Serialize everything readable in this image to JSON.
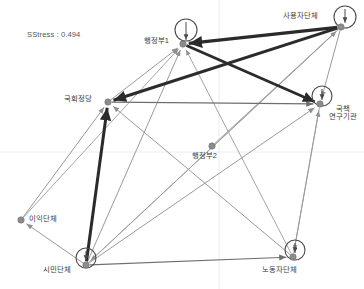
{
  "figure": {
    "type": "network-mds-plot",
    "width": 364,
    "height": 289,
    "background": "#ffffff",
    "annotation": {
      "label": "SStress : 0.494",
      "x": 27,
      "y": 30
    },
    "gridlines": {
      "color": "#ececec",
      "vertical_x": 219,
      "horizontal_y": 152
    }
  },
  "style": {
    "node_fill": "#8c8c8c",
    "node_stroke": "#6e6e6e",
    "node_radius": 3.2,
    "label_color": "#3a3a3a",
    "edge_thin_color": "#9a9a9a",
    "edge_mid_color": "#6f6f6f",
    "edge_bold_color": "#2b2b2b",
    "loop_color": "#4a4a4a"
  },
  "chart_data": {
    "type": "scatter",
    "title": "",
    "xlabel": "",
    "ylabel": "",
    "nodes": [
      {
        "id": "admin1",
        "label": "행정부1",
        "x": 183,
        "y": 44,
        "label_x": 144,
        "label_y": 37,
        "self_loop": true,
        "loop_cx": 186,
        "loop_cy": 30,
        "loop_r": 11
      },
      {
        "id": "employer",
        "label": "사용자단체",
        "x": 341,
        "y": 27,
        "label_x": 283,
        "label_y": 12,
        "self_loop": true,
        "loop_cx": 345,
        "loop_cy": 17,
        "loop_r": 11
      },
      {
        "id": "party",
        "label": "국회정당",
        "x": 108,
        "y": 102,
        "label_x": 64,
        "label_y": 95,
        "self_loop": false
      },
      {
        "id": "research",
        "label": "국책\n연구기관",
        "x": 320,
        "y": 104,
        "label_x": 329,
        "label_y": 105,
        "self_loop": true,
        "loop_cx": 322,
        "loop_cy": 96,
        "loop_r": 10
      },
      {
        "id": "admin2",
        "label": "행정부2",
        "x": 212,
        "y": 146,
        "label_x": 192,
        "label_y": 152,
        "self_loop": false
      },
      {
        "id": "interest",
        "label": "이익단체",
        "x": 21,
        "y": 220,
        "label_x": 29,
        "label_y": 215,
        "self_loop": false
      },
      {
        "id": "civic",
        "label": "시민단체",
        "x": 86,
        "y": 265,
        "label_x": 43,
        "label_y": 266,
        "self_loop": true,
        "loop_cx": 86,
        "loop_cy": 258,
        "loop_r": 10
      },
      {
        "id": "worker",
        "label": "노동자단체",
        "x": 293,
        "y": 257,
        "label_x": 262,
        "label_y": 266,
        "self_loop": true,
        "loop_cx": 295,
        "loop_cy": 250,
        "loop_r": 10
      }
    ],
    "edges": [
      {
        "from": "employer",
        "to": "admin1",
        "weight": 3.2,
        "class": "bold"
      },
      {
        "from": "employer",
        "to": "party",
        "weight": 3.0,
        "class": "bold"
      },
      {
        "from": "admin1",
        "to": "research",
        "weight": 2.8,
        "class": "bold"
      },
      {
        "from": "civic",
        "to": "party",
        "weight": 3.0,
        "class": "bold"
      },
      {
        "from": "employer",
        "to": "research",
        "weight": 1.0,
        "class": "thin"
      },
      {
        "from": "party",
        "to": "research",
        "weight": 1.2,
        "class": "mid"
      },
      {
        "from": "party",
        "to": "admin1",
        "weight": 1.0,
        "class": "thin"
      },
      {
        "from": "admin2",
        "to": "employer",
        "weight": 0.9,
        "class": "thin"
      },
      {
        "from": "interest",
        "to": "party",
        "weight": 1.0,
        "class": "thin"
      },
      {
        "from": "interest",
        "to": "admin1",
        "weight": 0.9,
        "class": "thin"
      },
      {
        "from": "civic",
        "to": "interest",
        "weight": 1.0,
        "class": "thin"
      },
      {
        "from": "civic",
        "to": "admin1",
        "weight": 1.0,
        "class": "thin"
      },
      {
        "from": "civic",
        "to": "employer",
        "weight": 0.9,
        "class": "thin"
      },
      {
        "from": "civic",
        "to": "research",
        "weight": 1.0,
        "class": "thin"
      },
      {
        "from": "civic",
        "to": "worker",
        "weight": 1.2,
        "class": "mid"
      },
      {
        "from": "worker",
        "to": "party",
        "weight": 1.0,
        "class": "thin"
      },
      {
        "from": "worker",
        "to": "research",
        "weight": 1.0,
        "class": "thin"
      },
      {
        "from": "worker",
        "to": "admin1",
        "weight": 0.9,
        "class": "thin"
      },
      {
        "from": "employer",
        "to": "civic",
        "weight": 0.9,
        "class": "thin"
      },
      {
        "from": "research",
        "to": "worker",
        "weight": 0.9,
        "class": "thin"
      }
    ],
    "legend": [],
    "grid": true
  }
}
